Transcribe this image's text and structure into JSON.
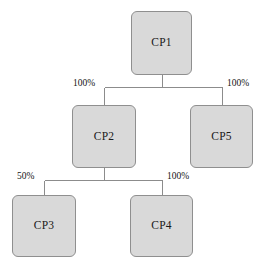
{
  "diagram": {
    "type": "tree",
    "canvas": {
      "width": 261,
      "height": 269
    },
    "style": {
      "node_fill": "#d9d9d9",
      "node_stroke": "#8f8f8f",
      "edge_stroke": "#8c8c8c",
      "text_color": "#1a1a1a",
      "background": "#ffffff"
    },
    "nodes": [
      {
        "id": "cp1",
        "label": "CP1",
        "x": 131,
        "y": 11,
        "w": 61,
        "h": 64
      },
      {
        "id": "cp2",
        "label": "CP2",
        "x": 72,
        "y": 105,
        "w": 64,
        "h": 63
      },
      {
        "id": "cp5",
        "label": "CP5",
        "x": 190,
        "y": 105,
        "w": 63,
        "h": 63
      },
      {
        "id": "cp3",
        "label": "CP3",
        "x": 12,
        "y": 195,
        "w": 64,
        "h": 62
      },
      {
        "id": "cp4",
        "label": "CP4",
        "x": 130,
        "y": 195,
        "w": 63,
        "h": 62
      }
    ],
    "edges": [
      {
        "id": "cp1-cp2",
        "from": "cp1",
        "to": "cp2",
        "label": "100%"
      },
      {
        "id": "cp1-cp5",
        "from": "cp1",
        "to": "cp5",
        "label": "100%"
      },
      {
        "id": "cp2-cp3",
        "from": "cp2",
        "to": "cp3",
        "label": "50%"
      },
      {
        "id": "cp2-cp4",
        "from": "cp2",
        "to": "cp4",
        "label": "100%"
      }
    ],
    "edge_labels": [
      {
        "id": "label-cp1-cp2",
        "text": "100%",
        "x": 73,
        "y": 79
      },
      {
        "id": "label-cp1-cp5",
        "text": "100%",
        "x": 227,
        "y": 79
      },
      {
        "id": "label-cp2-cp3",
        "text": "50%",
        "x": 17,
        "y": 172
      },
      {
        "id": "label-cp2-cp4",
        "text": "100%",
        "x": 167,
        "y": 172
      }
    ]
  }
}
